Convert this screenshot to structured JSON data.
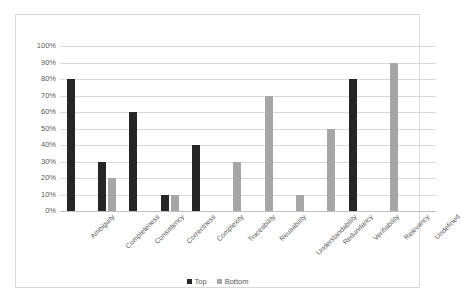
{
  "chart_data": {
    "type": "bar",
    "title": "",
    "xlabel": "",
    "ylabel": "",
    "ylim": [
      0,
      100
    ],
    "ytick_labels": [
      "100%",
      "90%",
      "80%",
      "70%",
      "60%",
      "50%",
      "40%",
      "30%",
      "20%",
      "10%",
      "0%"
    ],
    "ytick_values": [
      100,
      90,
      80,
      70,
      60,
      50,
      40,
      30,
      20,
      10,
      0
    ],
    "grid": true,
    "legend_position": "bottom",
    "categories": [
      "Ambiguity",
      "Completeness",
      "Consistency",
      "Correctness",
      "Complexity",
      "Traceability",
      "Reusability",
      "Understandability",
      "Redundancy",
      "Verifiability",
      "Relevancy",
      "Undefined"
    ],
    "series": [
      {
        "name": "Top",
        "color": "#262626",
        "values": [
          80,
          30,
          60,
          10,
          40,
          0,
          0,
          0,
          0,
          80,
          0,
          0
        ]
      },
      {
        "name": "Bottom",
        "color": "#a6a6a6",
        "values": [
          0,
          20,
          0,
          10,
          0,
          30,
          70,
          10,
          50,
          0,
          90,
          0
        ]
      }
    ]
  },
  "legend": {
    "items": [
      {
        "label": "Top",
        "color": "#262626"
      },
      {
        "label": "Bottom",
        "color": "#a6a6a6"
      }
    ]
  },
  "colors": {
    "top_series": "#262626",
    "bottom_series": "#a6a6a6",
    "gridline": "#d9d9d9",
    "border": "#d9d9d9",
    "text": "#595959",
    "background": "#ffffff"
  }
}
